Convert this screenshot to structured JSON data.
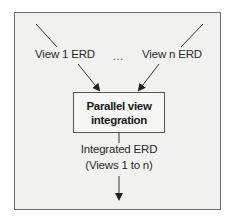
{
  "diagram": {
    "inputs": [
      {
        "label": "View 1 ERD"
      },
      {
        "label": "View n ERD"
      }
    ],
    "ellipsis": "…",
    "process": {
      "line1": "Parallel view",
      "line2": "integration"
    },
    "output": {
      "line1": "Integrated ERD",
      "line2": "(Views 1 to n)"
    },
    "colors": {
      "background": "#f1f1ef",
      "border": "#6d6d6d",
      "line": "#333333"
    }
  }
}
